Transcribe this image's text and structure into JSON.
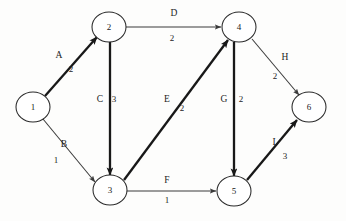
{
  "diagram": {
    "type": "directed-graph",
    "canvas": {
      "width": 346,
      "height": 221,
      "background": "#fdfdfc"
    },
    "stroke_color": "#1c1c1c",
    "node_fill": "#ffffff",
    "nodes": [
      {
        "id": "1",
        "label": "1",
        "cx": 33,
        "cy": 107,
        "rx": 17,
        "ry": 15
      },
      {
        "id": "2",
        "label": "2",
        "cx": 109,
        "cy": 27,
        "rx": 17,
        "ry": 15
      },
      {
        "id": "3",
        "label": "3",
        "cx": 110,
        "cy": 190,
        "rx": 17,
        "ry": 15
      },
      {
        "id": "4",
        "label": "4",
        "cx": 239,
        "cy": 27,
        "rx": 17,
        "ry": 15
      },
      {
        "id": "5",
        "label": "5",
        "cx": 234,
        "cy": 191,
        "rx": 17,
        "ry": 15
      },
      {
        "id": "6",
        "label": "6",
        "cx": 309,
        "cy": 107,
        "rx": 17,
        "ry": 15
      }
    ],
    "edges": [
      {
        "name": "A",
        "weight": "2",
        "from": "1",
        "to": "2",
        "thick": true,
        "x1": 45,
        "y1": 96,
        "x2": 97,
        "y2": 37,
        "name_x": 59,
        "name_y": 56,
        "weight_x": 71,
        "weight_y": 70
      },
      {
        "name": "B",
        "weight": "1",
        "from": "1",
        "to": "3",
        "thick": false,
        "x1": 43,
        "y1": 119,
        "x2": 95,
        "y2": 182,
        "name_x": 64,
        "name_y": 145,
        "weight_x": 56,
        "weight_y": 161
      },
      {
        "name": "C",
        "weight": "3",
        "from": "2",
        "to": "3",
        "thick": true,
        "x1": 110,
        "y1": 42,
        "x2": 110,
        "y2": 175,
        "name_x": 100,
        "name_y": 100,
        "weight_x": 114,
        "weight_y": 100
      },
      {
        "name": "D",
        "weight": "2",
        "from": "2",
        "to": "4",
        "thick": false,
        "x1": 126,
        "y1": 27,
        "x2": 221,
        "y2": 27,
        "name_x": 174,
        "name_y": 14,
        "weight_x": 172,
        "weight_y": 39
      },
      {
        "name": "E",
        "weight": "2",
        "from": "3",
        "to": "4",
        "thick": true,
        "x1": 124,
        "y1": 180,
        "x2": 228,
        "y2": 40,
        "name_x": 167,
        "name_y": 100,
        "weight_x": 182,
        "weight_y": 109
      },
      {
        "name": "F",
        "weight": "1",
        "from": "3",
        "to": "5",
        "thick": false,
        "x1": 127,
        "y1": 191,
        "x2": 216,
        "y2": 191,
        "name_x": 167,
        "name_y": 181,
        "weight_x": 167,
        "weight_y": 201
      },
      {
        "name": "G",
        "weight": "2",
        "from": "4",
        "to": "5",
        "thick": true,
        "x1": 234,
        "y1": 42,
        "x2": 234,
        "y2": 176,
        "name_x": 224,
        "name_y": 100,
        "weight_x": 241,
        "weight_y": 100
      },
      {
        "name": "H",
        "weight": "2",
        "from": "4",
        "to": "6",
        "thick": false,
        "x1": 252,
        "y1": 39,
        "x2": 299,
        "y2": 95,
        "name_x": 285,
        "name_y": 58,
        "weight_x": 275,
        "weight_y": 77
      },
      {
        "name": "I",
        "weight": "3",
        "from": "5",
        "to": "6",
        "thick": true,
        "x1": 247,
        "y1": 180,
        "x2": 297,
        "y2": 120,
        "name_x": 274,
        "name_y": 143,
        "weight_x": 285,
        "weight_y": 157
      }
    ]
  }
}
